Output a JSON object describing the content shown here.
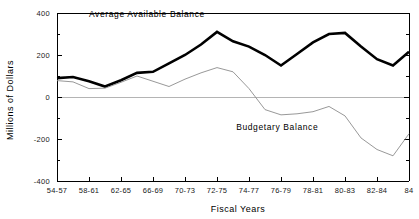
{
  "chart_data": {
    "type": "line",
    "title": "",
    "xlabel": "Fiscal Years",
    "ylabel": "Millions of Dollars",
    "categories": [
      "54-57",
      "58-61",
      "62-65",
      "66-69",
      "70-73",
      "72-75",
      "74-77",
      "76-79",
      "78-81",
      "80-83",
      "82-84",
      "84"
    ],
    "x_tick_labels": [
      "54-57",
      "58-61",
      "62-65",
      "66-69",
      "70-73",
      "72-75",
      "74-77",
      "76-79",
      "78-81",
      "80-83",
      "82-84",
      "84"
    ],
    "y_tick_labels": [
      "400",
      "200",
      "0",
      "-200",
      "-400"
    ],
    "y_tick_values": [
      400,
      200,
      0,
      -200,
      -400
    ],
    "y_minor_tick_values": [
      300,
      100,
      -100,
      -300
    ],
    "ylim": [
      -400,
      400
    ],
    "grid": false,
    "zero_line": true,
    "legend_position": "inline-annotation",
    "series": [
      {
        "name": "Average Available Balance",
        "label": "Average Available Balance",
        "color": "#000000",
        "line_width": 2.6,
        "x": [
          0,
          0.5,
          1,
          1.5,
          2,
          2.5,
          3,
          3.5,
          4,
          4.5,
          5,
          5.5,
          6,
          6.5,
          7,
          7.5,
          8,
          8.5,
          9,
          9.5,
          10,
          10.5,
          11
        ],
        "values": [
          90,
          95,
          75,
          50,
          80,
          115,
          120,
          160,
          200,
          250,
          310,
          265,
          240,
          200,
          150,
          205,
          260,
          300,
          305,
          240,
          180,
          150,
          215
        ]
      },
      {
        "name": "Budgetary Balance",
        "label": "Budgetary Balance",
        "color": "#8c8c8c",
        "line_width": 0.9,
        "x": [
          0,
          0.5,
          1,
          1.5,
          2,
          2.5,
          3,
          3.5,
          4,
          4.5,
          5,
          5.5,
          6,
          6.5,
          7,
          7.5,
          8,
          8.5,
          9,
          9.5,
          10,
          10.5,
          11
        ],
        "values": [
          78,
          72,
          40,
          42,
          70,
          100,
          75,
          50,
          85,
          115,
          140,
          120,
          40,
          -60,
          -85,
          -80,
          -70,
          -45,
          -90,
          -195,
          -250,
          -280,
          -175
        ]
      }
    ],
    "annotations": [
      {
        "text": "Average Available Balance",
        "x": 1.0,
        "y": 380,
        "name": "average-available-balance-label"
      },
      {
        "text": "Budgetary Balance",
        "x": 5.6,
        "y": -155,
        "name": "budgetary-balance-label"
      }
    ]
  }
}
